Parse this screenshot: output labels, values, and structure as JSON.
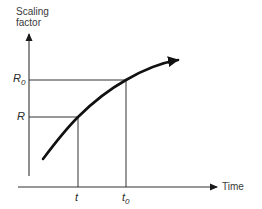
{
  "diagram": {
    "y_axis": {
      "label_line1": "Scaling",
      "label_line2": "factor"
    },
    "x_axis": {
      "label": "Time"
    },
    "y_markers": [
      {
        "symbol": "R",
        "subscript": "0",
        "y_px": 80
      },
      {
        "symbol": "R",
        "subscript": "",
        "y_px": 117
      }
    ],
    "x_markers": [
      {
        "symbol": "t",
        "subscript": "",
        "x_px": 78
      },
      {
        "symbol": "t",
        "subscript": "0",
        "x_px": 126
      }
    ],
    "curve": {
      "description": "Increasing concave-down curve with arrowhead",
      "points": [
        [
          43,
          159
        ],
        [
          78,
          117
        ],
        [
          126,
          80
        ],
        [
          182,
          59
        ]
      ]
    },
    "colors": {
      "line": "#1a1a1a",
      "axis": "#333333",
      "background": "#ffffff"
    }
  }
}
